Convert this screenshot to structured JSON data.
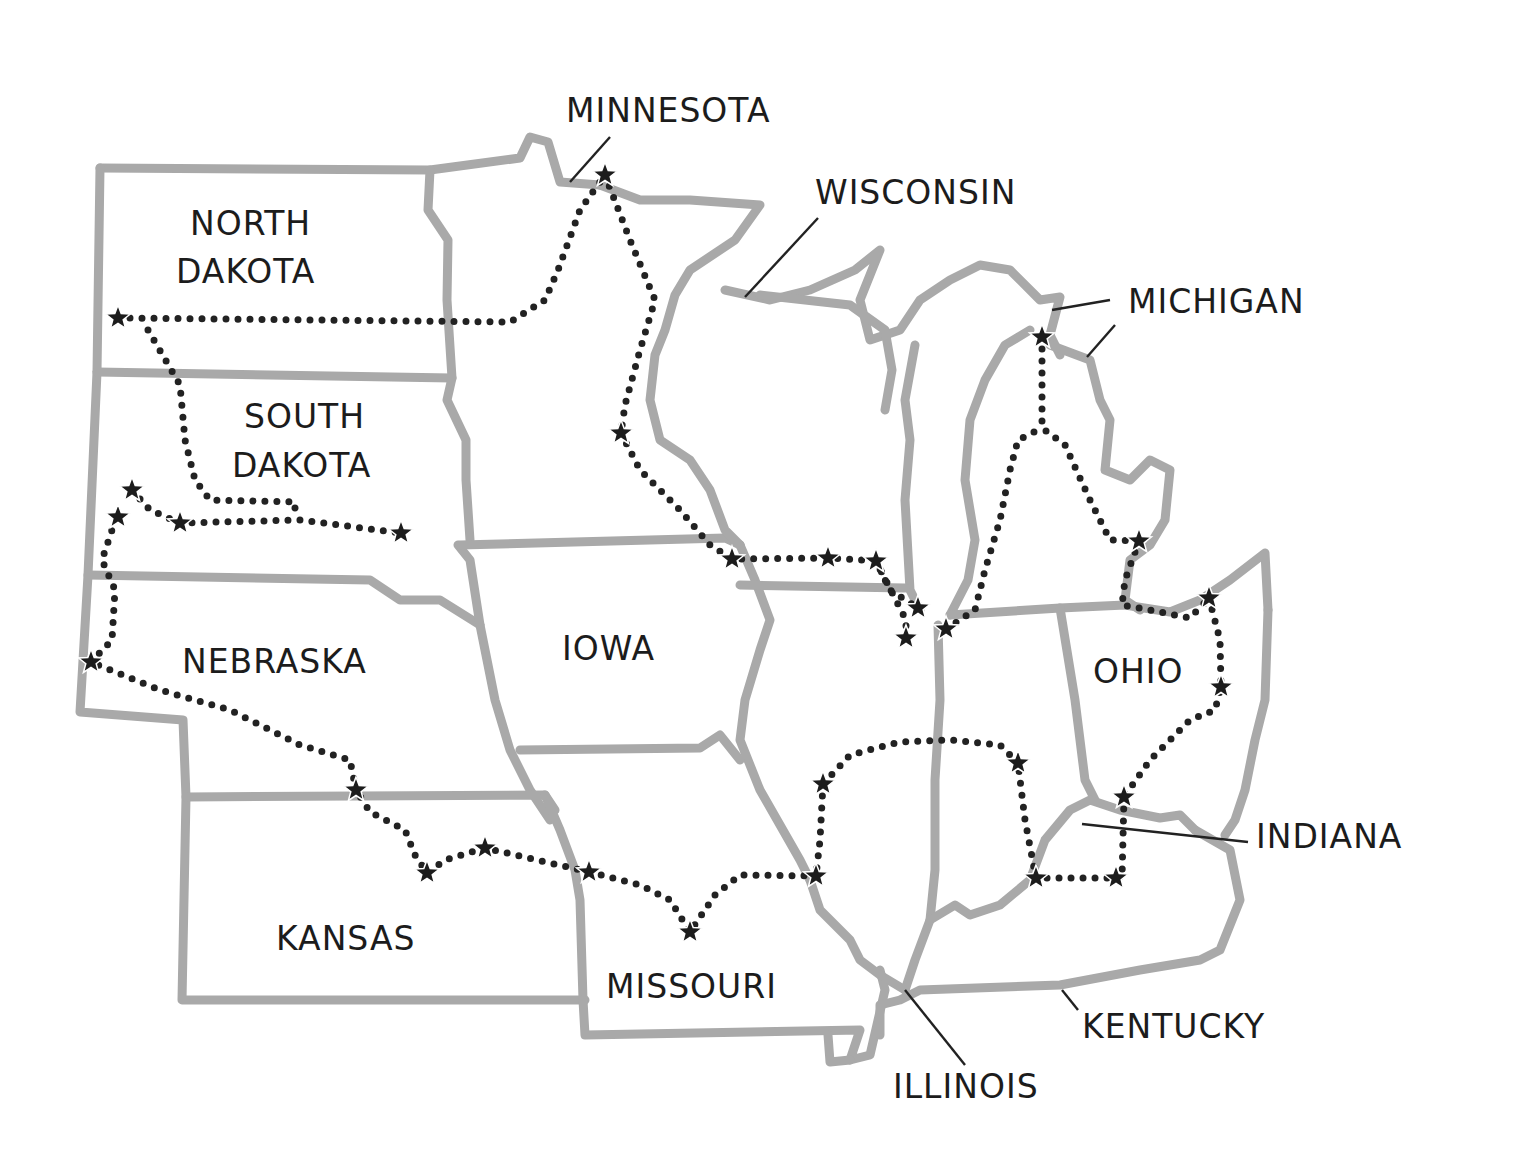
{
  "map": {
    "title": "Midwest route map",
    "colors": {
      "border": "#a9a9a9",
      "route": "#222222",
      "star": "#1c1c1c",
      "text": "#1c1c1c",
      "background": "#ffffff"
    },
    "state_labels": [
      {
        "id": "north-dakota-1",
        "text": "NORTH",
        "x": 190,
        "y": 235
      },
      {
        "id": "north-dakota-2",
        "text": "DAKOTA",
        "x": 176,
        "y": 283
      },
      {
        "id": "south-dakota-1",
        "text": "SOUTH",
        "x": 244,
        "y": 428
      },
      {
        "id": "south-dakota-2",
        "text": "DAKOTA",
        "x": 232,
        "y": 477
      },
      {
        "id": "nebraska",
        "text": "NEBRASKA",
        "x": 182,
        "y": 673
      },
      {
        "id": "iowa",
        "text": "IOWA",
        "x": 562,
        "y": 660
      },
      {
        "id": "kansas",
        "text": "KANSAS",
        "x": 276,
        "y": 950
      },
      {
        "id": "missouri",
        "text": "MISSOURI",
        "x": 606,
        "y": 998
      },
      {
        "id": "ohio",
        "text": "OHIO",
        "x": 1093,
        "y": 683
      },
      {
        "id": "minnesota",
        "text": "MINNESOTA",
        "x": 566,
        "y": 122
      },
      {
        "id": "wisconsin",
        "text": "WISCONSIN",
        "x": 815,
        "y": 204
      },
      {
        "id": "michigan",
        "text": "MICHIGAN",
        "x": 1128,
        "y": 313
      },
      {
        "id": "indiana",
        "text": "INDIANA",
        "x": 1256,
        "y": 848
      },
      {
        "id": "kentucky",
        "text": "KENTUCKY",
        "x": 1082,
        "y": 1038
      },
      {
        "id": "illinois",
        "text": "ILLINOIS",
        "x": 893,
        "y": 1098
      }
    ],
    "stars": [
      [
        118,
        318
      ],
      [
        605,
        175
      ],
      [
        621,
        433
      ],
      [
        132,
        490
      ],
      [
        118,
        517
      ],
      [
        180,
        523
      ],
      [
        401,
        533
      ],
      [
        732,
        559
      ],
      [
        828,
        558
      ],
      [
        876,
        561
      ],
      [
        918,
        608
      ],
      [
        906,
        638
      ],
      [
        946,
        629
      ],
      [
        1042,
        337
      ],
      [
        1139,
        541
      ],
      [
        1209,
        598
      ],
      [
        1221,
        687
      ],
      [
        1124,
        797
      ],
      [
        91,
        662
      ],
      [
        356,
        790
      ],
      [
        427,
        873
      ],
      [
        485,
        848
      ],
      [
        589,
        872
      ],
      [
        690,
        932
      ],
      [
        816,
        876
      ],
      [
        823,
        784
      ],
      [
        1018,
        763
      ],
      [
        1036,
        878
      ],
      [
        1116,
        878
      ]
    ]
  }
}
